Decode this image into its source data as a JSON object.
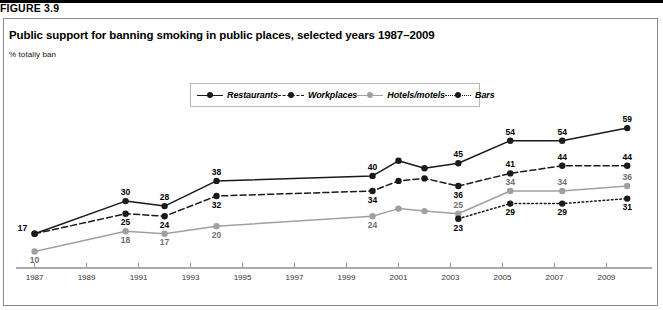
{
  "figure": {
    "label": "FIGURE 3.9",
    "title": "Public support for banning smoking in public places, selected years 1987–2009",
    "subtitle": "% totally ban"
  },
  "chart_data": {
    "type": "line",
    "title": "Public support for banning smoking in public places, selected years 1987–2009",
    "subtitle": "% totally ban",
    "xlabel": "",
    "ylabel": "% totally ban",
    "xlim": [
      1986.4,
      2010.6
    ],
    "ylim": [
      5,
      63
    ],
    "grid": false,
    "legend_position": "top-center",
    "xtick_labels": [
      "1987",
      "1989",
      "1991",
      "1993",
      "1995",
      "1997",
      "1999",
      "2001",
      "2003",
      "2005",
      "2007",
      "2009"
    ],
    "xticks": [
      1987,
      1989,
      1991,
      1993,
      1995,
      1997,
      1999,
      2001,
      2003,
      2005,
      2007,
      2009
    ],
    "x": [
      1987,
      1990.5,
      1992,
      1994,
      2000,
      2001,
      2002,
      2003.3,
      2005.3,
      2007.3,
      2009.8
    ],
    "series": [
      {
        "name": "Restaurants",
        "color": "#1a1a1a",
        "style": "solid",
        "values": [
          17,
          30,
          28,
          38,
          40,
          46,
          43,
          45,
          54,
          54,
          59
        ],
        "labels": [
          "17",
          "30",
          "28",
          "38",
          "40",
          "",
          "",
          "45",
          "54",
          "54",
          "59"
        ]
      },
      {
        "name": "Workplaces",
        "color": "#1a1a1a",
        "style": "dashed",
        "values": [
          17,
          25,
          24,
          32,
          34,
          38,
          39,
          36,
          41,
          44,
          44
        ],
        "labels": [
          "",
          "25",
          "24",
          "32",
          "34",
          "",
          "",
          "36",
          "41",
          "44",
          "44"
        ]
      },
      {
        "name": "Hotels/motels",
        "color": "#a0a0a0",
        "style": "solid-gray",
        "values": [
          10,
          18,
          17,
          20,
          24,
          27,
          26,
          25,
          34,
          34,
          36
        ],
        "labels": [
          "10",
          "18",
          "17",
          "20",
          "24",
          "",
          "",
          "25",
          "34",
          "34",
          "36"
        ]
      },
      {
        "name": "Bars",
        "color": "#1a1a1a",
        "style": "dotted",
        "values": [
          null,
          null,
          null,
          null,
          null,
          null,
          null,
          23,
          29,
          29,
          31
        ],
        "labels": [
          "",
          "",
          "",
          "",
          "",
          "",
          "",
          "23",
          "29",
          "29",
          "31"
        ]
      }
    ]
  },
  "colors": {
    "dark": "#1a1a1a",
    "gray": "#a0a0a0",
    "frame": "#8a8a8a",
    "axis": "#8f8f8f"
  }
}
